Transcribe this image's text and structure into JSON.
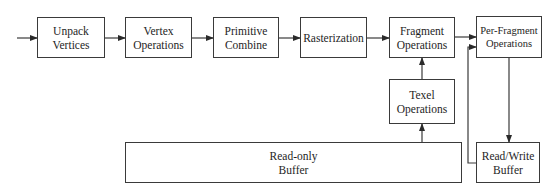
{
  "diagram": {
    "type": "pipeline-flowchart",
    "nodes": {
      "unpack": {
        "label": "Unpack\nVertices"
      },
      "vertex": {
        "label": "Vertex\nOperations"
      },
      "primitive": {
        "label": "Primitive\nCombine"
      },
      "raster": {
        "label": "Rasterization"
      },
      "fragment": {
        "label": "Fragment\nOperations"
      },
      "perfragment": {
        "label": "Per-Fragment\nOperations"
      },
      "texel": {
        "label": "Texel\nOperations"
      },
      "readonly": {
        "label": "Read-only\nBuffer"
      },
      "readwrite": {
        "label": "Read/Write\nBuffer"
      }
    },
    "edges": [
      {
        "from": "input",
        "to": "unpack"
      },
      {
        "from": "unpack",
        "to": "vertex"
      },
      {
        "from": "vertex",
        "to": "primitive"
      },
      {
        "from": "primitive",
        "to": "raster"
      },
      {
        "from": "raster",
        "to": "fragment"
      },
      {
        "from": "fragment",
        "to": "perfragment"
      },
      {
        "from": "texel",
        "to": "fragment"
      },
      {
        "from": "readonly",
        "to": "texel"
      },
      {
        "from": "perfragment",
        "to": "readwrite"
      },
      {
        "from": "readwrite",
        "to": "perfragment"
      }
    ],
    "colors": {
      "stroke": "#3a3a3a",
      "text": "#1e1e1e",
      "background": "#ffffff"
    }
  }
}
